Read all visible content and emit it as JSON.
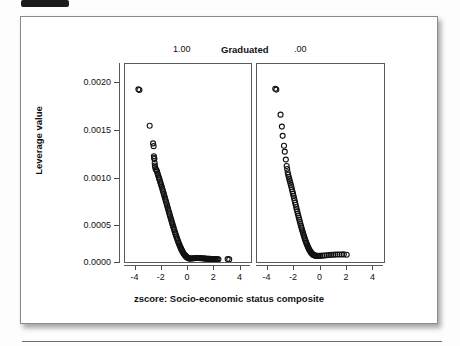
{
  "figure": {
    "grouping_variable_label": "Graduated",
    "panel_labels": [
      "1.00",
      ".00"
    ],
    "y_axis_title": "Leverage value",
    "x_axis_title": "zscore: Socio-economic status composite",
    "marker": "open-circle",
    "colors": {
      "marker_stroke": "#111111",
      "axis": "#5b5b5b",
      "text": "#111111",
      "panel_background": "#ffffff",
      "page_background": "#fdfdfd"
    }
  },
  "chart_data": {
    "type": "scatter",
    "title": "",
    "subtitle": "",
    "xlabel": "zscore: Socio-economic status composite",
    "ylabel": "Leverage value",
    "xlim": [
      -4.8,
      4.8
    ],
    "ylim": [
      0.0,
      0.00215
    ],
    "xticks": [
      -4,
      -2,
      0,
      2,
      4
    ],
    "xtick_labels": [
      "-4",
      "-2",
      "0",
      "2",
      "4"
    ],
    "yticks": [
      0.0,
      0.0005,
      0.001,
      0.0015,
      0.002
    ],
    "ytick_labels": [
      "0.0000",
      "0.0005",
      "0.0010",
      "0.0015",
      "0.0020"
    ],
    "grid": false,
    "legend": "none",
    "facet_variable": "Graduated",
    "panels": [
      {
        "label": "1.00",
        "points": [
          [
            -3.78,
            0.001875
          ],
          [
            -3.7,
            0.001868
          ],
          [
            -2.92,
            0.00148
          ],
          [
            -2.66,
            0.001288
          ],
          [
            -2.62,
            0.001258
          ],
          [
            -2.6,
            0.001148
          ],
          [
            -2.58,
            0.001132
          ],
          [
            -2.56,
            0.001118
          ],
          [
            -2.54,
            0.001075
          ],
          [
            -2.52,
            0.001048
          ],
          [
            -2.5,
            0.00103
          ],
          [
            -2.46,
            0.001008
          ],
          [
            -2.4,
            0.000995
          ],
          [
            -2.36,
            0.000982
          ],
          [
            -2.32,
            0.000962
          ],
          [
            -2.28,
            0.000944
          ],
          [
            -2.24,
            0.000926
          ],
          [
            -2.2,
            0.000908
          ],
          [
            -2.16,
            0.00089
          ],
          [
            -2.12,
            0.000872
          ],
          [
            -2.08,
            0.000853
          ],
          [
            -2.04,
            0.000834
          ],
          [
            -2.0,
            0.000816
          ],
          [
            -1.96,
            0.000796
          ],
          [
            -1.92,
            0.000776
          ],
          [
            -1.88,
            0.000757
          ],
          [
            -1.84,
            0.000737
          ],
          [
            -1.8,
            0.000717
          ],
          [
            -1.76,
            0.000697
          ],
          [
            -1.72,
            0.000677
          ],
          [
            -1.68,
            0.000657
          ],
          [
            -1.64,
            0.000637
          ],
          [
            -1.6,
            0.000617
          ],
          [
            -1.56,
            0.000597
          ],
          [
            -1.52,
            0.000577
          ],
          [
            -1.48,
            0.000557
          ],
          [
            -1.44,
            0.000537
          ],
          [
            -1.4,
            0.000517
          ],
          [
            -1.36,
            0.000497
          ],
          [
            -1.32,
            0.000477
          ],
          [
            -1.28,
            0.000458
          ],
          [
            -1.24,
            0.000438
          ],
          [
            -1.2,
            0.000419
          ],
          [
            -1.16,
            0.0004
          ],
          [
            -1.12,
            0.000381
          ],
          [
            -1.08,
            0.000362
          ],
          [
            -1.04,
            0.000344
          ],
          [
            -1.0,
            0.000326
          ],
          [
            -0.96,
            0.000308
          ],
          [
            -0.92,
            0.000291
          ],
          [
            -0.88,
            0.000274
          ],
          [
            -0.84,
            0.000257
          ],
          [
            -0.8,
            0.000241
          ],
          [
            -0.76,
            0.000225
          ],
          [
            -0.72,
            0.00021
          ],
          [
            -0.68,
            0.000195
          ],
          [
            -0.64,
            0.000181
          ],
          [
            -0.6,
            0.000167
          ],
          [
            -0.56,
            0.000154
          ],
          [
            -0.52,
            0.000142
          ],
          [
            -0.48,
            0.00013
          ],
          [
            -0.44,
            0.000119
          ],
          [
            -0.4,
            0.000108
          ],
          [
            -0.36,
            9.85e-05
          ],
          [
            -0.32,
            8.95e-05
          ],
          [
            -0.28,
            8.12e-05
          ],
          [
            -0.24,
            7.36e-05
          ],
          [
            -0.2,
            6.68e-05
          ],
          [
            -0.16,
            6.07e-05
          ],
          [
            -0.12,
            5.53e-05
          ],
          [
            -0.08,
            5.06e-05
          ],
          [
            -0.04,
            4.66e-05
          ],
          [
            0.0,
            4.34e-05
          ],
          [
            0.04,
            4.09e-05
          ],
          [
            0.08,
            3.91e-05
          ],
          [
            0.12,
            3.8e-05
          ],
          [
            0.16,
            3.75e-05
          ],
          [
            0.24,
            3.78e-05
          ],
          [
            0.32,
            3.88e-05
          ],
          [
            0.4,
            4e-05
          ],
          [
            0.48,
            4.12e-05
          ],
          [
            0.56,
            4.22e-05
          ],
          [
            0.64,
            4.28e-05
          ],
          [
            0.72,
            4.3e-05
          ],
          [
            0.8,
            4.28e-05
          ],
          [
            0.88,
            4.22e-05
          ],
          [
            0.96,
            4.14e-05
          ],
          [
            1.04,
            4.04e-05
          ],
          [
            1.12,
            3.94e-05
          ],
          [
            1.2,
            3.84e-05
          ],
          [
            1.28,
            3.74e-05
          ],
          [
            1.36,
            3.65e-05
          ],
          [
            1.44,
            3.57e-05
          ],
          [
            1.52,
            3.49e-05
          ],
          [
            1.6,
            3.42e-05
          ],
          [
            1.68,
            3.36e-05
          ],
          [
            1.76,
            3.3e-05
          ],
          [
            1.84,
            3.25e-05
          ],
          [
            1.92,
            3.2e-05
          ],
          [
            2.0,
            3.16e-05
          ],
          [
            2.08,
            3.12e-05
          ],
          [
            2.16,
            3.09e-05
          ],
          [
            2.24,
            3.06e-05
          ],
          [
            2.32,
            3.04e-05
          ],
          [
            3.02,
            3.15e-05
          ],
          [
            3.14,
            2.85e-05
          ]
        ],
        "n_visible_clusters": "dense band forming an L/hook shape with a slight rise near z=0.8",
        "notes": "High-leverage outliers at the extreme low end of SES; minimum leverage near z=0.15; two isolated points near z=3.1"
      },
      {
        "label": ".00",
        "points": [
          [
            -3.42,
            0.001882
          ],
          [
            -3.34,
            0.001872
          ],
          [
            -3.02,
            0.0016
          ],
          [
            -2.92,
            0.00147
          ],
          [
            -2.86,
            0.00137
          ],
          [
            -2.76,
            0.001262
          ],
          [
            -2.7,
            0.001198
          ],
          [
            -2.62,
            0.001112
          ],
          [
            -2.56,
            0.001042
          ],
          [
            -2.52,
            0.00101
          ],
          [
            -2.48,
            0.000975
          ],
          [
            -2.44,
            0.000948
          ],
          [
            -2.4,
            0.000922
          ],
          [
            -2.36,
            0.0009
          ],
          [
            -2.32,
            0.00088
          ],
          [
            -2.28,
            0.000858
          ],
          [
            -2.24,
            0.000836
          ],
          [
            -2.2,
            0.000814
          ],
          [
            -2.16,
            0.00079
          ],
          [
            -2.12,
            0.000766
          ],
          [
            -2.08,
            0.000742
          ],
          [
            -2.04,
            0.000718
          ],
          [
            -2.0,
            0.000694
          ],
          [
            -1.96,
            0.00067
          ],
          [
            -1.92,
            0.000646
          ],
          [
            -1.88,
            0.000622
          ],
          [
            -1.84,
            0.000598
          ],
          [
            -1.8,
            0.000574
          ],
          [
            -1.76,
            0.00055
          ],
          [
            -1.72,
            0.000527
          ],
          [
            -1.68,
            0.000504
          ],
          [
            -1.64,
            0.000481
          ],
          [
            -1.6,
            0.000459
          ],
          [
            -1.56,
            0.000437
          ],
          [
            -1.52,
            0.000415
          ],
          [
            -1.48,
            0.000394
          ],
          [
            -1.44,
            0.000373
          ],
          [
            -1.4,
            0.000353
          ],
          [
            -1.36,
            0.000333
          ],
          [
            -1.32,
            0.000314
          ],
          [
            -1.28,
            0.000295
          ],
          [
            -1.24,
            0.000277
          ],
          [
            -1.2,
            0.000259
          ],
          [
            -1.16,
            0.000242
          ],
          [
            -1.12,
            0.000226
          ],
          [
            -1.08,
            0.00021
          ],
          [
            -1.04,
            0.000195
          ],
          [
            -1.0,
            0.000181
          ],
          [
            -0.96,
            0.000167
          ],
          [
            -0.92,
            0.000154
          ],
          [
            -0.88,
            0.000142
          ],
          [
            -0.84,
            0.000131
          ],
          [
            -0.8,
            0.000121
          ],
          [
            -0.76,
            0.000112
          ],
          [
            -0.72,
            0.000104
          ],
          [
            -0.68,
            9.65e-05
          ],
          [
            -0.64,
            9e-05
          ],
          [
            -0.6,
            8.46e-05
          ],
          [
            -0.56,
            8e-05
          ],
          [
            -0.52,
            7.62e-05
          ],
          [
            -0.48,
            7.32e-05
          ],
          [
            -0.44,
            7.08e-05
          ],
          [
            -0.4,
            6.9e-05
          ],
          [
            -0.32,
            6.7e-05
          ],
          [
            -0.24,
            6.6e-05
          ],
          [
            -0.16,
            6.58e-05
          ],
          [
            -0.08,
            6.62e-05
          ],
          [
            0.0,
            6.7e-05
          ],
          [
            0.16,
            6.9e-05
          ],
          [
            0.32,
            7.12e-05
          ],
          [
            0.48,
            7.35e-05
          ],
          [
            0.64,
            7.56e-05
          ],
          [
            0.8,
            7.75e-05
          ],
          [
            0.96,
            7.9e-05
          ],
          [
            1.12,
            8.02e-05
          ],
          [
            1.28,
            8.12e-05
          ],
          [
            1.44,
            8.18e-05
          ],
          [
            1.6,
            8.22e-05
          ],
          [
            1.76,
            8.24e-05
          ],
          [
            1.98,
            7.9e-05
          ]
        ],
        "n_visible_clusters": "dense band forming an L shape, flat tail from z=-0.4 to z=2.0",
        "notes": "High-leverage outliers at the extreme low end of SES; flat minimum around z=-0.2; final isolated circle at z=2.0"
      }
    ]
  }
}
